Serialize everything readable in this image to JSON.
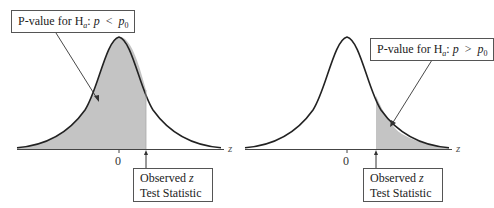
{
  "panels": [
    {
      "id": "left-tailed",
      "pvalue_label_prefix": "P-value for H",
      "pvalue_label_sub": "a",
      "pvalue_label_p": "p",
      "pvalue_label_op": "<",
      "pvalue_label_p0": "p",
      "pvalue_label_p0_sub": "0",
      "tick_label": "0",
      "axis_label": "z",
      "observed_line1": "Observed",
      "observed_line1_var": "z",
      "observed_line2": "Test Statistic"
    },
    {
      "id": "right-tailed",
      "pvalue_label_prefix": "P-value for H",
      "pvalue_label_sub": "a",
      "pvalue_label_p": "p",
      "pvalue_label_op": ">",
      "pvalue_label_p0": "p",
      "pvalue_label_p0_sub": "0",
      "tick_label": "0",
      "axis_label": "z",
      "observed_line1": "Observed",
      "observed_line1_var": "z",
      "observed_line2": "Test Statistic"
    }
  ],
  "colors": {
    "shade": "#c4c4c4",
    "curve": "#222222",
    "axis": "#444444"
  }
}
